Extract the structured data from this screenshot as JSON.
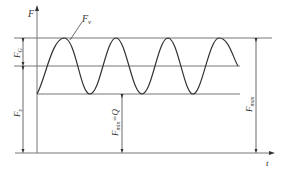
{
  "diagram": {
    "y_axis_label": "F",
    "x_axis_label": "t",
    "curve_label": "F",
    "curve_label_sub": "v",
    "labels": {
      "fg": "F",
      "fg_sub": "G",
      "fz": "F",
      "fz_sub": "z",
      "fmin": "F",
      "fmin_sub": "min",
      "fmin_eq": "=Q",
      "fmax": "F",
      "fmax_sub": "max"
    }
  }
}
